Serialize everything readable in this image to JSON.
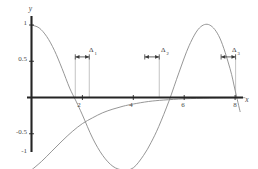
{
  "figure": {
    "background": "#ffffff",
    "axis_color": "#2b2b2b",
    "curve_color": "#8a8a8a",
    "annotation_color": "#3a3a3a",
    "label_color": "#4a4a4a"
  },
  "axes": {
    "x_axis_label": "x",
    "y_axis_label": "y",
    "x_ticks": [
      {
        "value": 2,
        "label": "2"
      },
      {
        "value": 4,
        "label": "4"
      },
      {
        "value": 6,
        "label": "6"
      },
      {
        "value": 8,
        "label": "8"
      }
    ],
    "y_ticks": [
      {
        "value": 1,
        "label": "1"
      },
      {
        "value": 0.5,
        "label": "0.5"
      },
      {
        "value": -0.5,
        "label": "-0.5"
      },
      {
        "value": -1,
        "label": "-1"
      }
    ]
  },
  "annotations": [
    {
      "name": "delta-1",
      "symbol": "Δ",
      "subscript": "1",
      "label": "Δ1"
    },
    {
      "name": "delta-2",
      "symbol": "Δ",
      "subscript": "2",
      "label": "Δ2"
    },
    {
      "name": "delta-3",
      "symbol": "Δ",
      "subscript": "3",
      "label": "Δ3"
    }
  ],
  "chart_data": {
    "type": "line",
    "title": "",
    "xlabel": "x",
    "ylabel": "y",
    "xlim": [
      0,
      8.6
    ],
    "ylim": [
      -1.12,
      1.12
    ],
    "grid": false,
    "legend": null,
    "x_ticks": [
      2,
      4,
      6,
      8
    ],
    "x_tick_labels": [
      "2",
      "4",
      "6",
      "8"
    ],
    "y_ticks": [
      1,
      0.5,
      -0.5,
      -1
    ],
    "y_tick_labels": [
      "1",
      "0.5",
      "-0.5",
      "-1"
    ],
    "series": [
      {
        "name": "cosine-wave",
        "color": "#8a8a8a",
        "description": "cosine-like oscillation starting at y=1",
        "x": [
          0,
          0.3,
          0.6,
          0.9,
          1.2,
          1.5,
          1.75,
          2.0,
          2.4,
          2.8,
          3.2,
          3.6,
          4.0,
          4.4,
          4.7,
          5.0,
          5.4,
          5.8,
          6.2,
          6.6,
          7.0,
          7.4,
          7.8,
          8.0,
          8.2
        ],
        "y": [
          1.0,
          0.96,
          0.84,
          0.65,
          0.4,
          0.13,
          -0.05,
          -0.24,
          -0.56,
          -0.8,
          -0.95,
          -1.0,
          -0.97,
          -0.8,
          -0.62,
          -0.4,
          -0.05,
          0.35,
          0.72,
          0.96,
          1.0,
          0.82,
          0.4,
          0.1,
          -0.2
        ]
      },
      {
        "name": "rising-exponential",
        "color": "#8a8a8a",
        "description": "monotonically rising curve from y=-1 approaching y=0 asymptotically",
        "x": [
          0,
          0.4,
          0.8,
          1.2,
          1.6,
          2.0,
          2.4,
          2.8,
          3.2,
          3.6,
          4.0,
          4.6,
          5.2,
          6.0,
          7.0,
          8.0,
          8.4
        ],
        "y": [
          -1.0,
          -0.88,
          -0.74,
          -0.6,
          -0.47,
          -0.36,
          -0.28,
          -0.21,
          -0.16,
          -0.12,
          -0.09,
          -0.055,
          -0.035,
          -0.018,
          -0.008,
          -0.004,
          -0.002
        ]
      }
    ],
    "annotations": [
      {
        "name": "delta-1",
        "label": "Δ1",
        "type": "double-arrow-interval",
        "y": 0.56,
        "x_start": 1.72,
        "x_end": 2.27,
        "droplines": [
          1.72,
          2.27
        ]
      },
      {
        "name": "delta-2",
        "label": "Δ2",
        "type": "double-arrow-interval",
        "y": 0.56,
        "x_start": 4.45,
        "x_end": 5.02,
        "droplines": [
          5.02
        ]
      },
      {
        "name": "delta-3",
        "label": "Δ3",
        "type": "double-arrow-interval",
        "y": 0.56,
        "x_start": 7.45,
        "x_end": 8.02,
        "droplines": [
          8.02
        ]
      }
    ]
  }
}
